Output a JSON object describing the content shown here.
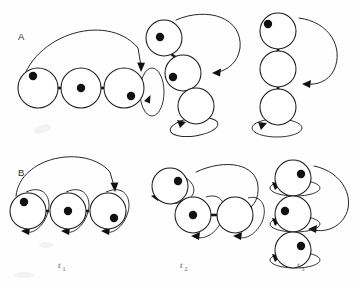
{
  "figure": {
    "title": "",
    "background_color": "#fefefe",
    "ink_color": "#111111",
    "node_fill": "#ffffff",
    "row_labels": [
      {
        "id": "A",
        "text": "A",
        "x": 18,
        "y": 40
      },
      {
        "id": "B",
        "text": "B",
        "x": 18,
        "y": 176
      }
    ],
    "column_labels": [
      {
        "id": "t1",
        "base": "t",
        "sub": "1",
        "x": 58,
        "y": 268
      },
      {
        "id": "t2",
        "base": "t",
        "sub": "2",
        "x": 180,
        "y": 268
      },
      {
        "id": "t3",
        "base": "t",
        "sub": "3",
        "x": 297,
        "y": 268
      }
    ],
    "panels": [
      {
        "id": "A-t1",
        "row": "A",
        "column": "t1",
        "arrangement": "horizontal-chain",
        "node_count": 3,
        "occupied_nodes": 3,
        "nodes": [
          {
            "cx": 38,
            "cy": 88,
            "r": 20,
            "dot": true,
            "dot_cx": 33,
            "dot_cy": 76,
            "dot_r": 4.2
          },
          {
            "cx": 81,
            "cy": 88,
            "r": 20,
            "dot": true,
            "dot_cx": 81,
            "dot_cy": 88,
            "dot_r": 4.2
          },
          {
            "cx": 124,
            "cy": 88,
            "r": 20,
            "dot": true,
            "dot_cx": 131,
            "dot_cy": 96,
            "dot_r": 4.2
          }
        ],
        "links": [
          {
            "from": 0,
            "to": 1
          },
          {
            "from": 1,
            "to": 2
          }
        ],
        "loop_count": 1,
        "arc_count": 1
      },
      {
        "id": "A-t2",
        "row": "A",
        "column": "t2",
        "arrangement": "diagonal-staircase",
        "node_count": 3,
        "occupied_nodes": 2,
        "nodes": [
          {
            "cx": 164,
            "cy": 38,
            "r": 18,
            "dot": true,
            "dot_cx": 160,
            "dot_cy": 37,
            "dot_r": 4.2
          },
          {
            "cx": 183,
            "cy": 73,
            "r": 18,
            "dot": true,
            "dot_cx": 173,
            "dot_cy": 77,
            "dot_r": 4.2
          },
          {
            "cx": 196,
            "cy": 106,
            "r": 18,
            "dot": false
          }
        ],
        "links": [
          {
            "from": 0,
            "to": 1
          },
          {
            "from": 1,
            "to": 2
          }
        ],
        "loop_count": 1,
        "arc_count": 1
      },
      {
        "id": "A-t3",
        "row": "A",
        "column": "t3",
        "arrangement": "vertical-stack",
        "node_count": 3,
        "occupied_nodes": 1,
        "nodes": [
          {
            "cx": 278,
            "cy": 31,
            "r": 18,
            "dot": true,
            "dot_cx": 268,
            "dot_cy": 24,
            "dot_r": 4.2
          },
          {
            "cx": 278,
            "cy": 69,
            "r": 18,
            "dot": false
          },
          {
            "cx": 278,
            "cy": 107,
            "r": 18,
            "dot": false
          }
        ],
        "links": [
          {
            "from": 0,
            "to": 1
          },
          {
            "from": 1,
            "to": 2
          }
        ],
        "loop_count": 1,
        "arc_count": 1
      },
      {
        "id": "B-t1",
        "row": "B",
        "column": "t1",
        "arrangement": "horizontal-chain",
        "node_count": 3,
        "occupied_nodes": 3,
        "nodes": [
          {
            "cx": 28,
            "cy": 211,
            "r": 18,
            "dot": true,
            "dot_cx": 24,
            "dot_cy": 202,
            "dot_r": 4.2
          },
          {
            "cx": 68,
            "cy": 211,
            "r": 18,
            "dot": true,
            "dot_cx": 68,
            "dot_cy": 211,
            "dot_r": 4.2
          },
          {
            "cx": 108,
            "cy": 211,
            "r": 18,
            "dot": true,
            "dot_cx": 114,
            "dot_cy": 218,
            "dot_r": 4.2
          }
        ],
        "links": [
          {
            "from": 0,
            "to": 1
          },
          {
            "from": 1,
            "to": 2
          }
        ],
        "loop_count": 3,
        "arc_count": 1
      },
      {
        "id": "B-t2",
        "row": "B",
        "column": "t2",
        "arrangement": "bent-chain",
        "node_count": 3,
        "occupied_nodes": 2,
        "nodes": [
          {
            "cx": 170,
            "cy": 186,
            "r": 18,
            "dot": true,
            "dot_cx": 178,
            "dot_cy": 181,
            "dot_r": 4.2
          },
          {
            "cx": 193,
            "cy": 215,
            "r": 18,
            "dot": true,
            "dot_cx": 193,
            "dot_cy": 215,
            "dot_r": 4.2
          },
          {
            "cx": 235,
            "cy": 215,
            "r": 18,
            "dot": false
          }
        ],
        "links": [
          {
            "from": 0,
            "to": 1
          },
          {
            "from": 1,
            "to": 2
          }
        ],
        "loop_count": 3,
        "arc_count": 1
      },
      {
        "id": "B-t3",
        "row": "B",
        "column": "t3",
        "arrangement": "vertical-stack",
        "node_count": 3,
        "occupied_nodes": 3,
        "nodes": [
          {
            "cx": 293,
            "cy": 178,
            "r": 18,
            "dot": true,
            "dot_cx": 301,
            "dot_cy": 174,
            "dot_r": 4.2
          },
          {
            "cx": 293,
            "cy": 214,
            "r": 18,
            "dot": true,
            "dot_cx": 285,
            "dot_cy": 211,
            "dot_r": 4.2
          },
          {
            "cx": 293,
            "cy": 250,
            "r": 18,
            "dot": true,
            "dot_cx": 301,
            "dot_cy": 246,
            "dot_r": 4.2
          }
        ],
        "links": [
          {
            "from": 0,
            "to": 1
          },
          {
            "from": 1,
            "to": 2
          }
        ],
        "loop_count": 3,
        "arc_count": 1
      }
    ]
  }
}
